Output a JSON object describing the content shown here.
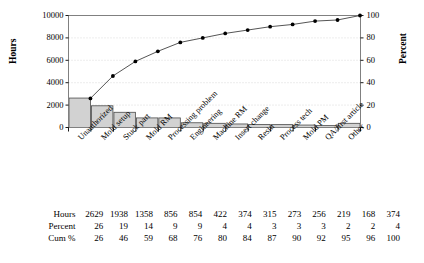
{
  "chart_data": {
    "type": "bar",
    "title": "",
    "subtitle": "",
    "xlabel": "",
    "ylabel": "Hours",
    "y2label": "Percent",
    "ylim": [
      0,
      10000
    ],
    "y2lim": [
      0,
      100
    ],
    "grid": true,
    "legend": "none",
    "categories": [
      "Unauthorized",
      "Mold setup",
      "Stuck part",
      "Mold RM",
      "Processing problem",
      "Engineering",
      "Machine RM",
      "Insert change",
      "Resin",
      "Process tech",
      "Mold PM",
      "QA/first article",
      "Other"
    ],
    "series": [
      {
        "name": "Hours",
        "type": "bar",
        "axis": "left",
        "values": [
          2629,
          1938,
          1358,
          856,
          854,
          422,
          374,
          315,
          273,
          256,
          219,
          168,
          374
        ]
      },
      {
        "name": "Cum %",
        "type": "line",
        "axis": "right",
        "values": [
          26,
          46,
          59,
          68,
          76,
          80,
          84,
          87,
          90,
          92,
          95,
          96,
          100
        ]
      }
    ],
    "percent": [
      26,
      19,
      14,
      9,
      9,
      4,
      4,
      3,
      3,
      3,
      2,
      2,
      4
    ],
    "yticks": [
      0,
      2000,
      4000,
      6000,
      8000,
      10000
    ],
    "y2ticks": [
      0,
      20,
      40,
      60,
      80,
      100
    ],
    "colors": {
      "bar_fill": "#d2d2d2",
      "bar_stroke": "#4a4a4a",
      "line": "#555555",
      "marker": "#000000",
      "frame": "#808080",
      "grid": "#cccccc",
      "text": "#000000"
    }
  },
  "table": {
    "rows": [
      {
        "label": "Hours",
        "values": [
          "2629",
          "1938",
          "1358",
          "856",
          "854",
          "422",
          "374",
          "315",
          "273",
          "256",
          "219",
          "168",
          "374"
        ]
      },
      {
        "label": "Percent",
        "values": [
          "26",
          "19",
          "14",
          "9",
          "9",
          "4",
          "4",
          "3",
          "3",
          "3",
          "2",
          "2",
          "4"
        ]
      },
      {
        "label": "Cum %",
        "values": [
          "26",
          "46",
          "59",
          "68",
          "76",
          "80",
          "84",
          "87",
          "90",
          "92",
          "95",
          "96",
          "100"
        ]
      }
    ]
  }
}
